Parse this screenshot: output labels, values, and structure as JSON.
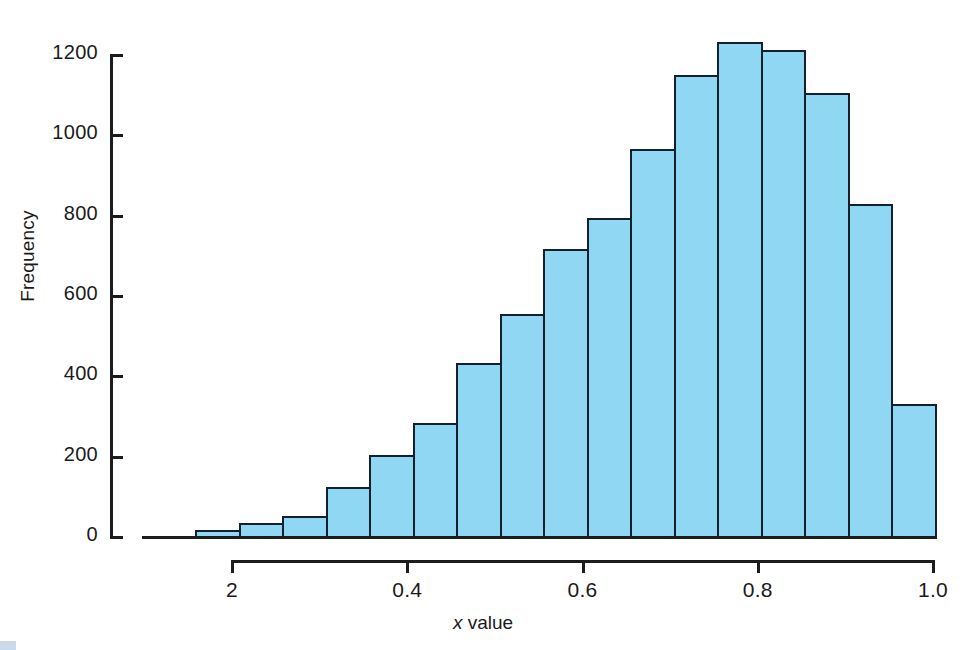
{
  "figure": {
    "background_color": "#ffffff",
    "bar_fill_color": "#8fd7f2",
    "bar_edge_color": "#14202e",
    "axis_color": "#1c1c1c"
  },
  "axes": {
    "y": {
      "label": "Frequency",
      "ticks": [
        0,
        200,
        400,
        600,
        800,
        1000,
        1200
      ],
      "tick_labels": [
        "0",
        "200",
        "400",
        "600",
        "800",
        "1000",
        "1200"
      ],
      "range": [
        0,
        1200
      ]
    },
    "x": {
      "label_prefix": "x",
      "label_suffix": " value",
      "label": "x value",
      "ticks": [
        0.2,
        0.4,
        0.6,
        0.8,
        1.0
      ],
      "tick_labels": [
        "2",
        "0.4",
        "0.6",
        "0.8",
        "1.0"
      ],
      "range": [
        0.16,
        1.0
      ]
    }
  },
  "chart_data": {
    "type": "bar",
    "title": "",
    "subtitle": "",
    "xlabel": "x value",
    "ylabel": "Frequency",
    "xlim": [
      0.16,
      1.0
    ],
    "ylim": [
      0,
      1200
    ],
    "grid": false,
    "legend": null,
    "bin_edges": [
      0.16,
      0.21,
      0.26,
      0.31,
      0.36,
      0.41,
      0.46,
      0.51,
      0.56,
      0.61,
      0.66,
      0.71,
      0.76,
      0.81,
      0.86,
      0.91,
      0.96,
      1.0
    ],
    "categories": [
      "0.16-0.21",
      "0.21-0.26",
      "0.26-0.31",
      "0.31-0.36",
      "0.36-0.41",
      "0.41-0.46",
      "0.46-0.51",
      "0.51-0.56",
      "0.56-0.61",
      "0.61-0.66",
      "0.66-0.71",
      "0.71-0.76",
      "0.76-0.81",
      "0.81-0.86",
      "0.86-0.91",
      "0.91-0.96",
      "0.96-1.0"
    ],
    "values": [
      18,
      35,
      53,
      125,
      203,
      284,
      434,
      555,
      716,
      795,
      966,
      1150,
      1233,
      1213,
      1106,
      830,
      332
    ],
    "bars": [
      {
        "index": 0,
        "value": 18
      },
      {
        "index": 1,
        "value": 35
      },
      {
        "index": 2,
        "value": 53
      },
      {
        "index": 3,
        "value": 125
      },
      {
        "index": 4,
        "value": 203
      },
      {
        "index": 5,
        "value": 284
      },
      {
        "index": 6,
        "value": 434
      },
      {
        "index": 7,
        "value": 555
      },
      {
        "index": 8,
        "value": 716
      },
      {
        "index": 9,
        "value": 795
      },
      {
        "index": 10,
        "value": 966
      },
      {
        "index": 11,
        "value": 1150
      },
      {
        "index": 12,
        "value": 1233
      },
      {
        "index": 13,
        "value": 1213
      },
      {
        "index": 14,
        "value": 1106
      },
      {
        "index": 15,
        "value": 830
      },
      {
        "index": 16,
        "value": 332
      }
    ]
  }
}
